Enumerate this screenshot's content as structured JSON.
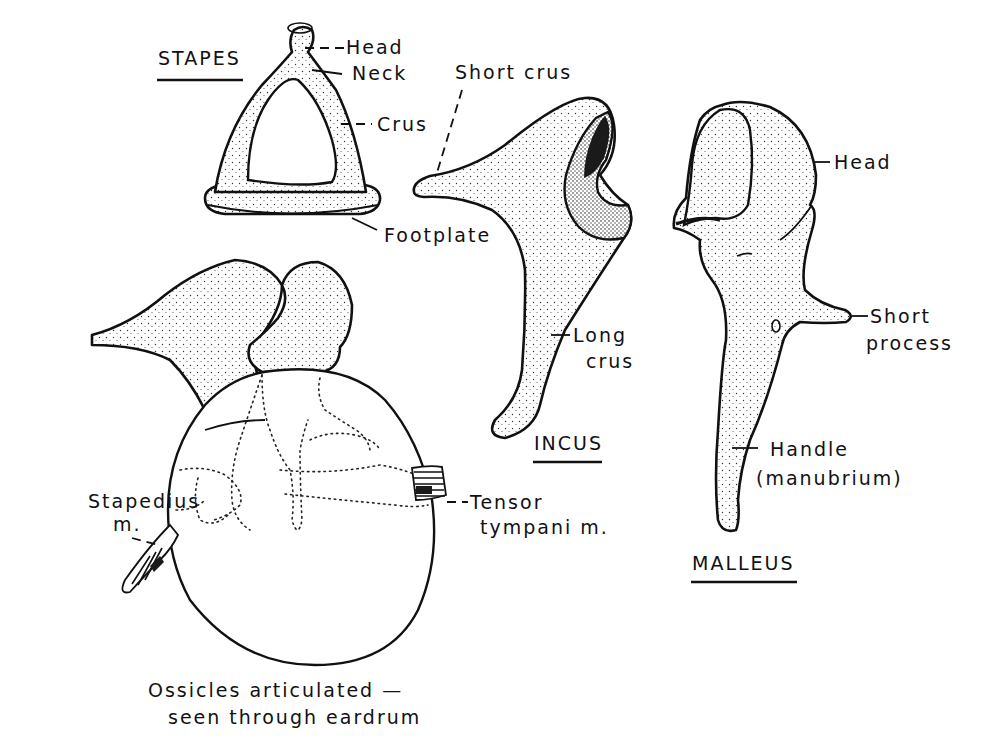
{
  "figure": {
    "caption_line1": "Ossicles articulated —",
    "caption_line2": "seen through eardrum"
  },
  "stapes": {
    "title": "STAPES",
    "labels": {
      "head": "Head",
      "neck": "Neck",
      "crus": "Crus",
      "footplate": "Footplate"
    }
  },
  "incus": {
    "title": "INCUS",
    "labels": {
      "short_crus": "Short crus",
      "long_crus_line1": "Long",
      "long_crus_line2": "crus"
    }
  },
  "malleus": {
    "title": "MALLEUS",
    "labels": {
      "head": "Head",
      "short_process_line1": "Short",
      "short_process_line2": "process",
      "handle_line1": "Handle",
      "handle_line2": "(manubrium)"
    }
  },
  "articulated": {
    "labels": {
      "stapedius_line1": "Stapedius",
      "stapedius_line2": "m.",
      "tensor_line1": "Tensor",
      "tensor_line2": "tympani m."
    }
  }
}
